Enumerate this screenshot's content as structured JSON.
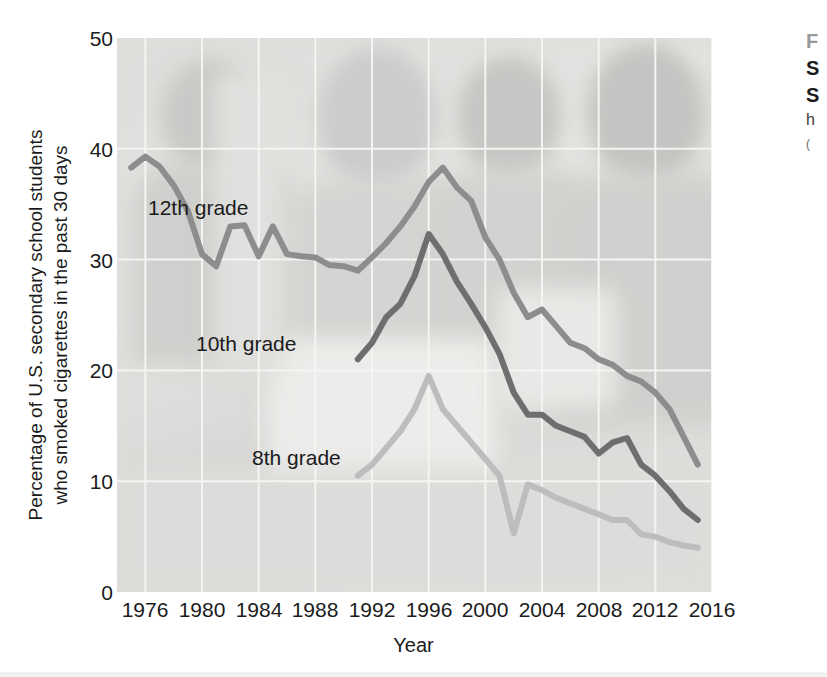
{
  "figure": {
    "caption_marker": "F",
    "caption_title_line1": "S",
    "caption_title_line2": "S",
    "caption_body": "h",
    "caption_source": "("
  },
  "axes": {
    "x_title": "Year",
    "y_title_line1": "Percentage of U.S. secondary school students",
    "y_title_line2": "who smoked cigarettes in the past 30 days",
    "x_ticks": [
      "1976",
      "1980",
      "1984",
      "1988",
      "1992",
      "1996",
      "2000",
      "2004",
      "2008",
      "2012",
      "2016"
    ],
    "y_ticks": [
      "0",
      "10",
      "20",
      "30",
      "40",
      "50"
    ]
  },
  "series_labels": {
    "grade12": "12th grade",
    "grade10": "10th grade",
    "grade8": "8th grade"
  },
  "colors": {
    "plot_background": "#dededc",
    "grid": "#f4f4f2",
    "grade12_line": "#8d8d8d",
    "grade10_line": "#6e6e6e",
    "grade8_line": "#bdbdbd",
    "text": "#1b1b1b"
  },
  "chart_data": {
    "type": "line",
    "title": "",
    "xlabel": "Year",
    "ylabel": "Percentage of U.S. secondary school students who smoked cigarettes in the past 30 days",
    "xlim": [
      1974,
      2016
    ],
    "ylim": [
      0,
      50
    ],
    "xticks": [
      1976,
      1980,
      1984,
      1988,
      1992,
      1996,
      2000,
      2004,
      2008,
      2012,
      2016
    ],
    "yticks": [
      0,
      10,
      20,
      30,
      40,
      50
    ],
    "grid": true,
    "legend": "inline-labels",
    "series": [
      {
        "name": "12th grade",
        "color": "#8d8d8d",
        "x": [
          1975,
          1976,
          1977,
          1978,
          1979,
          1980,
          1981,
          1982,
          1983,
          1984,
          1985,
          1986,
          1987,
          1988,
          1989,
          1990,
          1991,
          1992,
          1993,
          1994,
          1995,
          1996,
          1997,
          1998,
          1999,
          2000,
          2001,
          2002,
          2003,
          2004,
          2005,
          2006,
          2007,
          2008,
          2009,
          2010,
          2011,
          2012,
          2013,
          2014,
          2015
        ],
        "y": [
          38.3,
          39.3,
          38.4,
          36.7,
          34.4,
          30.5,
          29.4,
          33.0,
          33.1,
          30.3,
          33.0,
          30.5,
          30.3,
          30.2,
          29.5,
          29.4,
          29.0,
          30.2,
          31.5,
          33.0,
          34.8,
          37.0,
          38.3,
          36.5,
          35.3,
          32.0,
          30.0,
          27.0,
          24.8,
          25.5,
          24.0,
          22.5,
          22.0,
          21.0,
          20.5,
          19.5,
          19.0,
          18.0,
          16.5,
          14.0,
          11.5
        ]
      },
      {
        "name": "10th grade",
        "color": "#6e6e6e",
        "x": [
          1991,
          1992,
          1993,
          1994,
          1995,
          1996,
          1997,
          1998,
          1999,
          2000,
          2001,
          2002,
          2003,
          2004,
          2005,
          2006,
          2007,
          2008,
          2009,
          2010,
          2011,
          2012,
          2013,
          2014,
          2015
        ],
        "y": [
          21.0,
          22.5,
          24.8,
          26.0,
          28.5,
          32.3,
          30.5,
          28.0,
          26.0,
          23.9,
          21.5,
          18.0,
          16.0,
          16.0,
          15.0,
          14.5,
          14.0,
          12.5,
          13.5,
          13.9,
          11.5,
          10.5,
          9.1,
          7.5,
          6.5
        ]
      },
      {
        "name": "8th grade",
        "color": "#bdbdbd",
        "x": [
          1991,
          1992,
          1993,
          1994,
          1995,
          1996,
          1997,
          1998,
          1999,
          2000,
          2001,
          2002,
          2003,
          2004,
          2005,
          2006,
          2007,
          2008,
          2009,
          2010,
          2011,
          2012,
          2013,
          2014,
          2015
        ],
        "y": [
          10.5,
          11.5,
          13.0,
          14.5,
          16.5,
          19.5,
          16.5,
          15.0,
          13.5,
          12.0,
          10.5,
          5.3,
          9.7,
          9.2,
          8.5,
          8.0,
          7.5,
          7.0,
          6.5,
          6.5,
          5.2,
          5.0,
          4.5,
          4.2,
          4.0
        ]
      }
    ]
  }
}
